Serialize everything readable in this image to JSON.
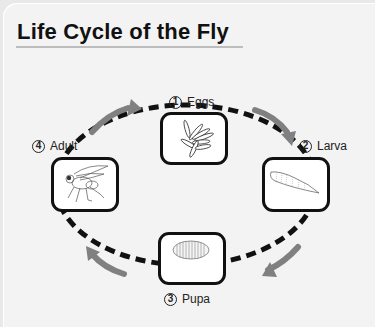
{
  "title": "Life Cycle of the Fly",
  "stages": [
    {
      "number": "1",
      "name": "Eggs",
      "icon": "eggs-icon"
    },
    {
      "number": "2",
      "name": "Larva",
      "icon": "larva-icon"
    },
    {
      "number": "3",
      "name": "Pupa",
      "icon": "pupa-icon"
    },
    {
      "number": "4",
      "name": "Adult",
      "icon": "adult-fly-icon"
    }
  ],
  "colors": {
    "background": "#f3f3f3",
    "box_border": "#111111",
    "cycle_line": "#111111",
    "arrow": "#808080"
  }
}
